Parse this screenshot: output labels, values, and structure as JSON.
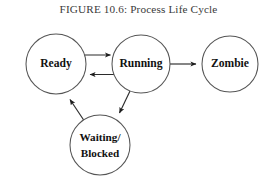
{
  "figure": {
    "title": "FIGURE 10.6: Process Life Cycle",
    "background_color": "#ffffff",
    "stroke_color": "#555555",
    "edge_color": "#2b2b2b",
    "text_color": "#111111"
  },
  "diagram": {
    "type": "state-machine",
    "nodes": [
      {
        "id": "ready",
        "label": "Ready",
        "shape": "circle",
        "cx": 56,
        "cy": 64,
        "r": 30
      },
      {
        "id": "running",
        "label": "Running",
        "shape": "circle",
        "cx": 141,
        "cy": 64,
        "r": 29
      },
      {
        "id": "zombie",
        "label": "Zombie",
        "shape": "circle",
        "cx": 230,
        "cy": 64,
        "r": 28
      },
      {
        "id": "waiting-blocked",
        "label_line1": "Waiting/",
        "label_line2": "Blocked",
        "shape": "circle",
        "cx": 100,
        "cy": 145,
        "r": 30
      }
    ],
    "edges": [
      {
        "id": "ready-to-running",
        "from": "Ready",
        "to": "Running",
        "style": "orthogonal",
        "direction": "right"
      },
      {
        "id": "running-to-ready",
        "from": "Running",
        "to": "Ready",
        "style": "orthogonal",
        "direction": "left"
      },
      {
        "id": "running-to-zombie",
        "from": "Running",
        "to": "Zombie",
        "style": "straight",
        "direction": "right"
      },
      {
        "id": "running-to-waiting",
        "from": "Running",
        "to": "Waiting/Blocked",
        "style": "diagonal",
        "direction": "down-left"
      },
      {
        "id": "waiting-to-ready",
        "from": "Waiting/Blocked",
        "to": "Ready",
        "style": "diagonal",
        "direction": "up-left"
      }
    ]
  }
}
